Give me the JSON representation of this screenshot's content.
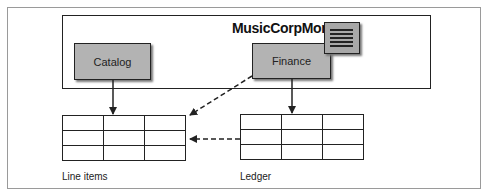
{
  "diagram": {
    "monolith": {
      "title": "MusicCorpMono"
    },
    "services": [
      {
        "label": "Catalog"
      },
      {
        "label": "Finance"
      }
    ],
    "tables": [
      {
        "caption": "Line items",
        "rows": 3,
        "cols": 3
      },
      {
        "caption": "Ledger",
        "rows": 3,
        "cols": 3
      }
    ],
    "edges": [
      {
        "from": "Catalog",
        "to": "Line items",
        "style": "solid"
      },
      {
        "from": "Finance",
        "to": "Ledger",
        "style": "solid"
      },
      {
        "from": "Finance",
        "to": "Line items",
        "style": "dashed"
      },
      {
        "from": "Ledger",
        "to": "Line items",
        "style": "dashed"
      }
    ],
    "colors": {
      "box_fill": "#b3b3b3",
      "stroke": "#222222",
      "frame": "#9a9a9a"
    }
  }
}
